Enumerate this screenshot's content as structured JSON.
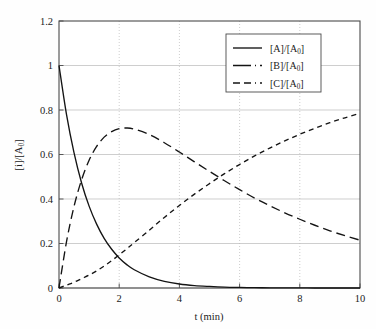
{
  "chart_data": {
    "type": "line",
    "title": "",
    "xlabel": "t (min)",
    "ylabel": "[i]/[A₀]",
    "xlim": [
      0,
      10
    ],
    "ylim": [
      0,
      1.2
    ],
    "grid": true,
    "legend_position": "top-right",
    "x_ticks": [
      "0",
      "2",
      "4",
      "6",
      "8",
      "10"
    ],
    "x_tick_values": [
      0,
      2,
      4,
      6,
      8,
      10
    ],
    "y_ticks": [
      "0",
      "0.2",
      "0.4",
      "0.6",
      "0.8",
      "1",
      "1.2"
    ],
    "y_tick_values": [
      0,
      0.2,
      0.4,
      0.6,
      0.8,
      1.0,
      1.2
    ],
    "x": [
      0,
      0.25,
      0.5,
      0.75,
      1,
      1.25,
      1.5,
      1.75,
      2,
      2.25,
      2.5,
      3,
      3.5,
      4,
      4.5,
      5,
      5.5,
      6,
      6.5,
      7,
      7.5,
      8,
      8.5,
      9,
      9.5,
      10
    ],
    "series": [
      {
        "name": "[A]/[A₀]",
        "style": "solid",
        "color": "#141414",
        "values": [
          1.0,
          0.779,
          0.607,
          0.472,
          0.368,
          0.287,
          0.223,
          0.174,
          0.135,
          0.105,
          0.082,
          0.05,
          0.03,
          0.018,
          0.011,
          0.007,
          0.004,
          0.0025,
          0.0015,
          0.0009,
          0.00055,
          0.00034,
          0.0002,
          0.00012,
          7e-05,
          4.5e-05
        ]
      },
      {
        "name": "[B]/[A₀]",
        "style": "long-dash",
        "color": "#141414",
        "values": [
          0.0,
          0.208,
          0.367,
          0.486,
          0.574,
          0.636,
          0.678,
          0.703,
          0.716,
          0.719,
          0.714,
          0.69,
          0.653,
          0.611,
          0.567,
          0.524,
          0.482,
          0.442,
          0.404,
          0.37,
          0.338,
          0.309,
          0.282,
          0.257,
          0.235,
          0.215
        ]
      },
      {
        "name": "[C]/[A₀]",
        "style": "short-dash",
        "color": "#141414",
        "values": [
          0.0,
          0.013,
          0.026,
          0.042,
          0.058,
          0.077,
          0.099,
          0.123,
          0.149,
          0.176,
          0.204,
          0.26,
          0.317,
          0.371,
          0.422,
          0.469,
          0.514,
          0.555,
          0.594,
          0.629,
          0.661,
          0.691,
          0.718,
          0.743,
          0.765,
          0.785
        ]
      }
    ],
    "annotations": []
  },
  "legend": {
    "entries": [
      {
        "label_main": "[A]/[A",
        "label_sub": "0",
        "label_tail": "]"
      },
      {
        "label_main": "[B]/[A",
        "label_sub": "0",
        "label_tail": "]"
      },
      {
        "label_main": "[C]/[A",
        "label_sub": "0",
        "label_tail": "]"
      }
    ]
  },
  "axes": {
    "x_title": "t (min)",
    "y_title_main": "[i]/[A",
    "y_title_sub": "0",
    "y_title_tail": "]"
  }
}
